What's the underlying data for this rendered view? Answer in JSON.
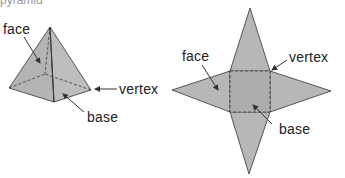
{
  "header": {
    "cut_text": "pyramid"
  },
  "colors": {
    "face_fill": "#b7b7b7",
    "face_fill_dark": "#a9a9a9",
    "base_fill": "#adadad",
    "edge": "#333333",
    "label": "#222222"
  },
  "pyramid": {
    "title": "square pyramid (3D)",
    "labels": {
      "face": "face",
      "vertex": "vertex",
      "base": "base"
    }
  },
  "net": {
    "title": "net of square pyramid",
    "labels": {
      "face": "face",
      "vertex": "vertex",
      "base": "base"
    }
  }
}
